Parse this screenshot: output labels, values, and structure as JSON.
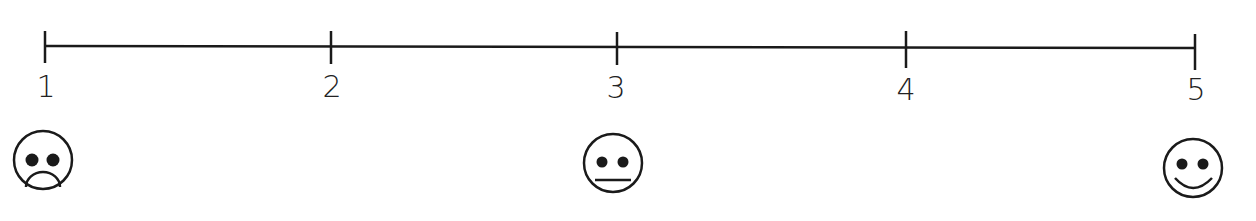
{
  "scale": {
    "type": "likert-rating-scale",
    "line_color": "#1a1a1a",
    "points": [
      {
        "label": "1",
        "x": 45
      },
      {
        "label": "2",
        "x": 331
      },
      {
        "label": "3",
        "x": 617
      },
      {
        "label": "4",
        "x": 906
      },
      {
        "label": "5",
        "x": 1195
      }
    ],
    "faces": [
      {
        "name": "sad-face-icon",
        "at": "1"
      },
      {
        "name": "neutral-face-icon",
        "at": "3"
      },
      {
        "name": "happy-face-icon",
        "at": "5"
      }
    ]
  }
}
